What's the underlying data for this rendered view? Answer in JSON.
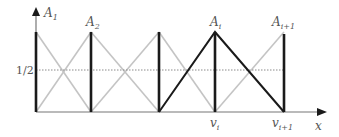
{
  "diagram": {
    "y_axis_label_half": "1/2",
    "x_axis_label": "x",
    "top_labels": [
      {
        "base": "A",
        "sub": "1"
      },
      {
        "base": "A",
        "sub": "2"
      },
      {
        "base": "A",
        "sub": "i"
      },
      {
        "base": "A",
        "sub": "i+1"
      }
    ],
    "bottom_labels": [
      {
        "base": "v",
        "sub": "i"
      },
      {
        "base": "v",
        "sub": "i+1"
      }
    ],
    "colors": {
      "thick": "#1a1a1a",
      "gray": "#bdbdbd",
      "axis": "#777777",
      "dashed": "#888888"
    }
  }
}
